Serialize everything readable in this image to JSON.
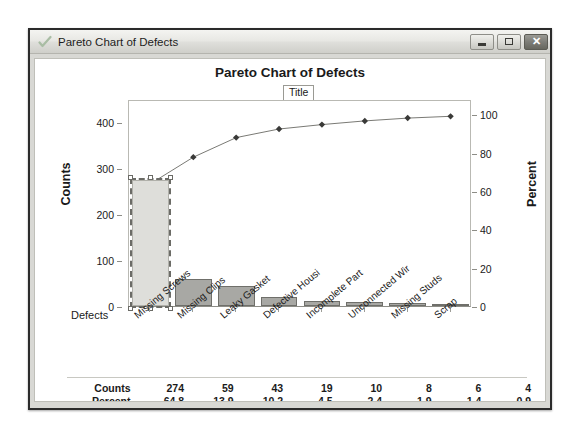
{
  "window": {
    "title": "Pareto Chart of Defects",
    "icon": "check-icon",
    "buttons": {
      "minimize": "minimize-icon",
      "maximize": "maximize-icon",
      "close": "✕"
    }
  },
  "tooltip": {
    "label": "Title"
  },
  "row_label": "Defects",
  "colors": {
    "bar_fill": "#a8a8a4",
    "bar_stroke": "#6f6f6a",
    "selected_fill": "#dededa",
    "selection_dash": "#6b6b66",
    "line": "#7a7a75",
    "marker": "#3a3a38",
    "axis": "#8d8d87",
    "text": "#1a1a1a"
  },
  "chart_data": {
    "type": "bar",
    "title": "Pareto Chart of Defects",
    "xlabel": "Defects",
    "ylabel": "Counts",
    "y2label": "Percent",
    "ylim": [
      0,
      450
    ],
    "y2lim": [
      0,
      108
    ],
    "grid": false,
    "legend": "none",
    "categories": [
      "Missing Screws",
      "Missing Clips",
      "Leaky Gasket",
      "Defective Housi",
      "Incomplete Part",
      "Unconnected Wir",
      "Missing Studs",
      "Scrap"
    ],
    "yticks": [
      0,
      100,
      200,
      300,
      400
    ],
    "y2ticks": [
      0,
      20,
      40,
      60,
      80,
      100
    ],
    "series": [
      {
        "name": "Counts",
        "type": "bar",
        "axis": "left",
        "values": [
          274,
          59,
          43,
          19,
          10,
          8,
          6,
          4
        ]
      },
      {
        "name": "Cum %",
        "type": "line",
        "axis": "right",
        "values": [
          64.8,
          78.7,
          88.9,
          93.4,
          95.7,
          97.6,
          99.1,
          100.0
        ]
      }
    ],
    "selected_index": 0,
    "table": {
      "row_headers": [
        "Counts",
        "Percent",
        "Cum %"
      ],
      "rows": [
        [
          "274",
          "59",
          "43",
          "19",
          "10",
          "8",
          "6",
          "4"
        ],
        [
          "64.8",
          "13.9",
          "10.2",
          "4.5",
          "2.4",
          "1.9",
          "1.4",
          "0.9"
        ],
        [
          "64.8",
          "78.7",
          "88.9",
          "93.4",
          "95.7",
          "97.6",
          "99.1",
          "100.0"
        ]
      ]
    }
  }
}
